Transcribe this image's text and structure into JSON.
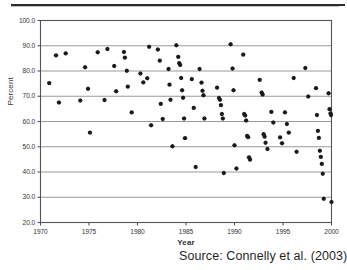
{
  "figure": {
    "source_note": "Source: Connelly et al. (2003)"
  },
  "chart_data": {
    "type": "scatter",
    "title": "",
    "xlabel": "Year",
    "ylabel": "Percent",
    "xlim": [
      1970,
      2000
    ],
    "ylim": [
      20.0,
      100.0
    ],
    "xticks": [
      1970,
      1975,
      1980,
      1985,
      1990,
      1995,
      2000
    ],
    "xtick_labels": [
      "1970",
      "1975",
      "1980",
      "1985",
      "1990",
      "1995",
      "2000"
    ],
    "yticks": [
      20.0,
      30.0,
      40.0,
      50.0,
      60.0,
      70.0,
      80.0,
      90.0,
      100.0
    ],
    "ytick_labels": [
      "20.0",
      "30.0",
      "40.0",
      "50.0",
      "60.0",
      "70.0",
      "80.0",
      "90.0",
      "100.0"
    ],
    "grid": "horizontal",
    "grid_color": "#999999",
    "legend": "none",
    "marker": "diamond-plus",
    "marker_color": "#1a1a1a",
    "frame_color": "#555555",
    "series": [
      {
        "name": "Percent by Year",
        "points": [
          [
            1970.9,
            75.2
          ],
          [
            1971.6,
            86.2
          ],
          [
            1971.9,
            67.5
          ],
          [
            1972.6,
            87.0
          ],
          [
            1974.1,
            68.3
          ],
          [
            1974.6,
            81.5
          ],
          [
            1974.9,
            73.0
          ],
          [
            1975.1,
            55.6
          ],
          [
            1975.9,
            87.4
          ],
          [
            1976.6,
            68.5
          ],
          [
            1976.9,
            88.7
          ],
          [
            1977.6,
            82.0
          ],
          [
            1977.8,
            72.0
          ],
          [
            1978.6,
            87.5
          ],
          [
            1978.7,
            85.3
          ],
          [
            1978.9,
            80.1
          ],
          [
            1979.0,
            73.8
          ],
          [
            1979.4,
            63.6
          ],
          [
            1980.3,
            79.0
          ],
          [
            1980.6,
            75.5
          ],
          [
            1981.0,
            77.1
          ],
          [
            1981.2,
            89.6
          ],
          [
            1981.4,
            58.5
          ],
          [
            1982.1,
            88.5
          ],
          [
            1982.3,
            84.1
          ],
          [
            1982.4,
            67.0
          ],
          [
            1982.6,
            61.0
          ],
          [
            1983.2,
            80.8
          ],
          [
            1983.3,
            74.6
          ],
          [
            1983.4,
            68.6
          ],
          [
            1983.6,
            50.2
          ],
          [
            1984.0,
            90.2
          ],
          [
            1984.2,
            85.6
          ],
          [
            1984.3,
            83.1
          ],
          [
            1984.4,
            82.4
          ],
          [
            1984.5,
            77.2
          ],
          [
            1984.6,
            72.4
          ],
          [
            1984.7,
            69.4
          ],
          [
            1984.8,
            61.2
          ],
          [
            1984.9,
            53.4
          ],
          [
            1985.6,
            76.8
          ],
          [
            1985.8,
            65.4
          ],
          [
            1986.0,
            42.0
          ],
          [
            1986.4,
            80.8
          ],
          [
            1986.6,
            75.4
          ],
          [
            1986.7,
            72.2
          ],
          [
            1986.8,
            70.4
          ],
          [
            1986.9,
            61.2
          ],
          [
            1988.2,
            73.4
          ],
          [
            1988.4,
            69.3
          ],
          [
            1988.5,
            68.6
          ],
          [
            1988.6,
            66.5
          ],
          [
            1988.7,
            63.0
          ],
          [
            1988.8,
            61.2
          ],
          [
            1988.9,
            39.6
          ],
          [
            1989.6,
            90.6
          ],
          [
            1989.8,
            81.0
          ],
          [
            1989.9,
            72.4
          ],
          [
            1990.0,
            50.6
          ],
          [
            1990.2,
            41.4
          ],
          [
            1990.9,
            86.5
          ],
          [
            1991.0,
            63.0
          ],
          [
            1991.1,
            62.4
          ],
          [
            1991.2,
            60.4
          ],
          [
            1991.3,
            54.3
          ],
          [
            1991.4,
            53.8
          ],
          [
            1991.5,
            45.8
          ],
          [
            1991.6,
            44.9
          ],
          [
            1992.6,
            76.5
          ],
          [
            1992.8,
            71.5
          ],
          [
            1992.9,
            70.7
          ],
          [
            1993.0,
            55.0
          ],
          [
            1993.1,
            54.0
          ],
          [
            1993.2,
            51.6
          ],
          [
            1993.4,
            49.1
          ],
          [
            1993.8,
            63.8
          ],
          [
            1994.0,
            59.6
          ],
          [
            1994.7,
            53.7
          ],
          [
            1994.9,
            51.4
          ],
          [
            1995.2,
            63.6
          ],
          [
            1995.4,
            59.0
          ],
          [
            1995.6,
            55.6
          ],
          [
            1996.1,
            77.2
          ],
          [
            1996.4,
            48.0
          ],
          [
            1997.3,
            81.2
          ],
          [
            1997.6,
            69.9
          ],
          [
            1998.4,
            73.2
          ],
          [
            1998.5,
            62.6
          ],
          [
            1998.6,
            56.3
          ],
          [
            1998.7,
            53.5
          ],
          [
            1998.8,
            48.4
          ],
          [
            1998.9,
            46.0
          ],
          [
            1999.0,
            43.2
          ],
          [
            1999.1,
            39.3
          ],
          [
            1999.2,
            29.4
          ],
          [
            1999.7,
            71.2
          ],
          [
            1999.8,
            64.9
          ],
          [
            1999.9,
            63.2
          ],
          [
            1999.95,
            62.6
          ],
          [
            2000.0,
            28.1
          ]
        ]
      }
    ]
  }
}
